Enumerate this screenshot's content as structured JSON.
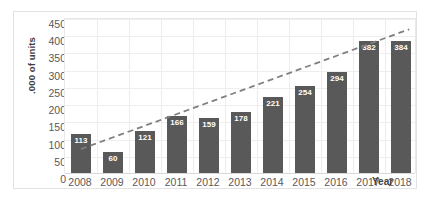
{
  "chart_data": {
    "type": "bar",
    "title": "",
    "subtitle": "",
    "xlabel": "Year",
    "ylabel": ".000 of units",
    "categories": [
      "2008",
      "2009",
      "2010",
      "2011",
      "2012",
      "2013",
      "2014",
      "2015",
      "2016",
      "2017",
      "2018"
    ],
    "values": [
      113,
      60,
      121,
      166,
      159,
      178,
      221,
      254,
      294,
      382,
      384
    ],
    "ylim": [
      0,
      450
    ],
    "yticks": [
      0,
      50,
      100,
      150,
      200,
      250,
      300,
      350,
      400,
      450
    ],
    "ytick_labels": [
      "0",
      "50",
      "100",
      "150",
      "200",
      "250",
      "300",
      "350",
      "400",
      "450"
    ],
    "grid": true,
    "legend": "none",
    "data_labels": [
      "113",
      "60",
      "121",
      "166",
      "159",
      "178",
      "221",
      "254",
      "294",
      "382",
      "384"
    ],
    "series": [
      {
        "name": "Units",
        "type": "bar",
        "color": "#595959",
        "values": [
          113,
          60,
          121,
          166,
          159,
          178,
          221,
          254,
          294,
          382,
          384
        ]
      },
      {
        "name": "Trendline",
        "type": "line",
        "style": "dashed",
        "color": "#808080",
        "x_start": 2008,
        "x_end": 2019,
        "y_start": 70,
        "y_end": 420
      }
    ],
    "colors": {
      "bar": "#595959",
      "trendline": "#808080",
      "grid": "#eeeeee",
      "axis_text": "#595959",
      "axis_title": "#3f3f3f",
      "label_text": "#ffffff",
      "frame": "#e3e3e3",
      "background": "#ffffff"
    }
  }
}
